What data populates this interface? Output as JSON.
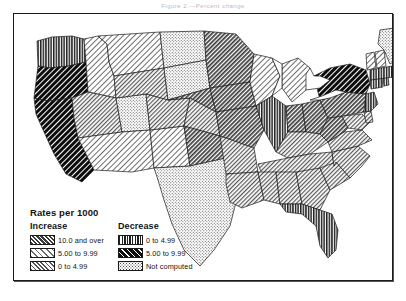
{
  "top_caption": "Figure 2.—Percent change",
  "legend": {
    "title": "Rates per 1000",
    "increase_head": "Increase",
    "decrease_head": "Decrease",
    "increase": [
      {
        "label": "10.0 and over",
        "pattern": "hatch-dense-fine",
        "swatch_name": "swatch-increase-10-and-over"
      },
      {
        "label": "5.00 to 9.99",
        "pattern": "hatch-light",
        "swatch_name": "swatch-increase-5-to-999"
      },
      {
        "label": "0 to 4.99",
        "pattern": "hatch-medium",
        "swatch_name": "swatch-increase-0-to-499"
      }
    ],
    "decrease": [
      {
        "label": "0 to 4.99",
        "pattern": "vertical-lines",
        "swatch_name": "swatch-decrease-0-to-499"
      },
      {
        "label": "5.00 to 9.99",
        "pattern": "hatch-bold-black",
        "swatch_name": "swatch-decrease-5-to-999"
      }
    ],
    "other": [
      {
        "label": "Not computed",
        "pattern": "stipple",
        "swatch_name": "swatch-not-computed"
      }
    ]
  },
  "map": {
    "name": "united-states-choropleth",
    "ocean_color": "#ffffff",
    "outline_color": "#1a1a1a",
    "states": [
      {
        "code": "WA",
        "pattern": "vertical-lines",
        "class_label": "Decrease 0 to 4.99"
      },
      {
        "code": "OR",
        "pattern": "hatch-bold-black",
        "class_label": "Decrease 5.00 to 9.99"
      },
      {
        "code": "CA",
        "pattern": "hatch-bold-black",
        "class_label": "Decrease 5.00 to 9.99"
      },
      {
        "code": "ID",
        "pattern": "hatch-light",
        "class_label": "Increase 5.00 to 9.99"
      },
      {
        "code": "MT",
        "pattern": "hatch-light",
        "class_label": "Increase 5.00 to 9.99"
      },
      {
        "code": "NV",
        "pattern": "hatch-medium",
        "class_label": "Increase 0 to 4.99"
      },
      {
        "code": "UT",
        "pattern": "stipple",
        "class_label": "Not computed"
      },
      {
        "code": "AZ",
        "pattern": "hatch-light",
        "class_label": "Increase 5.00 to 9.99"
      },
      {
        "code": "NM",
        "pattern": "hatch-light",
        "class_label": "Increase 5.00 to 9.99"
      },
      {
        "code": "WY",
        "pattern": "hatch-medium",
        "class_label": "Increase 0 to 4.99"
      },
      {
        "code": "CO",
        "pattern": "hatch-medium",
        "class_label": "Increase 0 to 4.99"
      },
      {
        "code": "ND",
        "pattern": "stipple",
        "class_label": "Not computed"
      },
      {
        "code": "SD",
        "pattern": "stipple",
        "class_label": "Not computed"
      },
      {
        "code": "NE",
        "pattern": "hatch-dense-fine",
        "class_label": "Increase 10.0 and over"
      },
      {
        "code": "KS",
        "pattern": "hatch-medium",
        "class_label": "Increase 0 to 4.99"
      },
      {
        "code": "OK",
        "pattern": "hatch-dense-fine",
        "class_label": "Increase 10.0 and over"
      },
      {
        "code": "TX",
        "pattern": "stipple",
        "class_label": "Not computed"
      },
      {
        "code": "MN",
        "pattern": "hatch-dense-fine",
        "class_label": "Increase 10.0 and over"
      },
      {
        "code": "IA",
        "pattern": "hatch-dense-fine",
        "class_label": "Increase 10.0 and over"
      },
      {
        "code": "MO",
        "pattern": "hatch-dense-fine",
        "class_label": "Increase 10.0 and over"
      },
      {
        "code": "AR",
        "pattern": "hatch-medium",
        "class_label": "Increase 0 to 4.99"
      },
      {
        "code": "LA",
        "pattern": "hatch-medium",
        "class_label": "Increase 0 to 4.99"
      },
      {
        "code": "WI",
        "pattern": "hatch-light",
        "class_label": "Increase 5.00 to 9.99"
      },
      {
        "code": "IL",
        "pattern": "vertical-lines",
        "class_label": "Decrease 0 to 4.99"
      },
      {
        "code": "MI",
        "pattern": "hatch-light",
        "class_label": "Increase 5.00 to 9.99"
      },
      {
        "code": "IN",
        "pattern": "hatch-dense-fine",
        "class_label": "Increase 10.0 and over"
      },
      {
        "code": "OH",
        "pattern": "hatch-dense-fine",
        "class_label": "Increase 10.0 and over"
      },
      {
        "code": "KY",
        "pattern": "hatch-medium",
        "class_label": "Increase 0 to 4.99"
      },
      {
        "code": "TN",
        "pattern": "hatch-medium",
        "class_label": "Increase 0 to 4.99"
      },
      {
        "code": "MS",
        "pattern": "hatch-medium",
        "class_label": "Increase 0 to 4.99"
      },
      {
        "code": "AL",
        "pattern": "hatch-medium",
        "class_label": "Increase 0 to 4.99"
      },
      {
        "code": "GA",
        "pattern": "hatch-medium",
        "class_label": "Increase 0 to 4.99"
      },
      {
        "code": "FL",
        "pattern": "vertical-lines",
        "class_label": "Decrease 0 to 4.99"
      },
      {
        "code": "SC",
        "pattern": "hatch-medium",
        "class_label": "Increase 0 to 4.99"
      },
      {
        "code": "NC",
        "pattern": "hatch-medium",
        "class_label": "Increase 0 to 4.99"
      },
      {
        "code": "VA",
        "pattern": "hatch-medium",
        "class_label": "Increase 0 to 4.99"
      },
      {
        "code": "WV",
        "pattern": "hatch-dense-fine",
        "class_label": "Increase 10.0 and over"
      },
      {
        "code": "MD",
        "pattern": "hatch-medium",
        "class_label": "Increase 0 to 4.99"
      },
      {
        "code": "DE",
        "pattern": "hatch-medium",
        "class_label": "Increase 0 to 4.99"
      },
      {
        "code": "PA",
        "pattern": "hatch-dense-fine",
        "class_label": "Increase 10.0 and over"
      },
      {
        "code": "NY",
        "pattern": "hatch-bold-black",
        "class_label": "Decrease 5.00 to 9.99"
      },
      {
        "code": "NJ",
        "pattern": "vertical-lines",
        "class_label": "Decrease 0 to 4.99"
      },
      {
        "code": "CT",
        "pattern": "vertical-lines",
        "class_label": "Decrease 0 to 4.99"
      },
      {
        "code": "RI",
        "pattern": "vertical-lines",
        "class_label": "Decrease 0 to 4.99"
      },
      {
        "code": "MA",
        "pattern": "vertical-lines",
        "class_label": "Decrease 0 to 4.99"
      },
      {
        "code": "VT",
        "pattern": "hatch-light",
        "class_label": "Increase 5.00 to 9.99"
      },
      {
        "code": "NH",
        "pattern": "hatch-light",
        "class_label": "Increase 5.00 to 9.99"
      },
      {
        "code": "ME",
        "pattern": "stipple",
        "class_label": "Not computed"
      }
    ]
  }
}
